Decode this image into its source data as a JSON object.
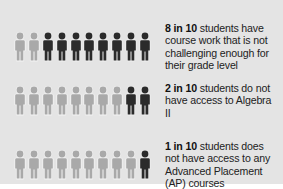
{
  "colors": {
    "background": "#e4e4e4",
    "highlight_person": "#2b2b2b",
    "base_person": "#a9a9a9",
    "text": "#222222"
  },
  "icon": "person-icon",
  "rows": [
    {
      "stat": "8 in 10",
      "text": " students have course work that is not challenging enough for their grade level",
      "highlighted": 8,
      "total": 10,
      "highlight_side": "right"
    },
    {
      "stat": "2 in 10",
      "text": " students do not have access to Algebra II",
      "highlighted": 2,
      "total": 10,
      "highlight_side": "right"
    },
    {
      "stat": "1 in 10",
      "text": " students does not have access to any Advanced Placement (AP) courses",
      "highlighted": 1,
      "total": 10,
      "highlight_side": "right"
    }
  ],
  "chart_data": {
    "type": "pictogram",
    "title": "",
    "unit": "students out of 10",
    "categories": [
      "Course work not challenging enough for their grade level",
      "No access to Algebra II",
      "No access to any Advanced Placement (AP) courses"
    ],
    "values": [
      8,
      2,
      1
    ],
    "total_per_row": 10,
    "labels": [
      "8 in 10 students have course work that is not challenging enough for their grade level",
      "2 in 10 students do not have access to Algebra II",
      "1 in 10 students does not have access to any Advanced Placement (AP) courses"
    ]
  }
}
